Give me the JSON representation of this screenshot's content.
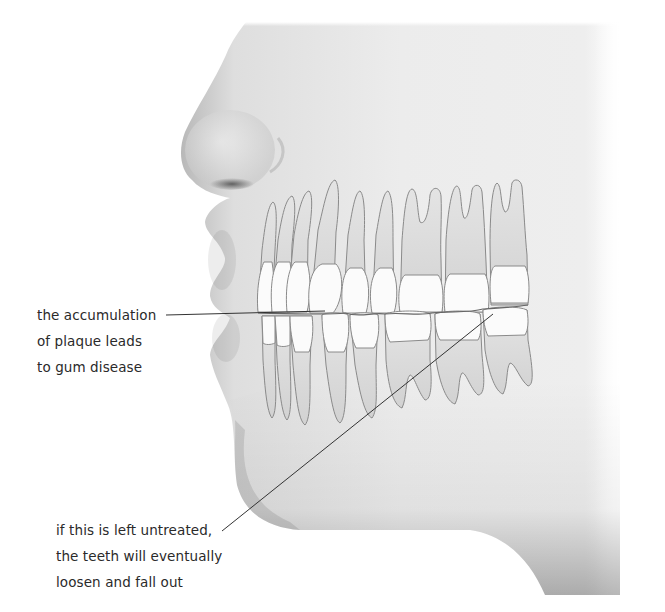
{
  "figure": {
    "colors": {
      "background": "#ffffff",
      "skin_light": "#f0f0f0",
      "skin_mid": "#d8d8d8",
      "skin_dark": "#9a9a9a",
      "tooth_enamel": "#fbfbfb",
      "tooth_root": "#dcdcdc",
      "tooth_outline": "#8a8a8a",
      "leader_line": "#333333",
      "text": "#2a2a2a"
    }
  },
  "annotations": [
    {
      "lines": [
        "the accumulation",
        "of plaque leads",
        "to gum disease"
      ],
      "pointer": {
        "from": [
          166,
          315
        ],
        "to": [
          325,
          311
        ]
      }
    },
    {
      "lines": [
        "if this is left untreated,",
        "the teeth will eventually",
        "loosen and fall out"
      ],
      "pointer": {
        "from": [
          222,
          531
        ],
        "to": [
          493,
          314
        ]
      }
    }
  ]
}
